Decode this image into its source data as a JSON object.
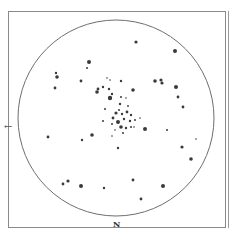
{
  "chart_data": {
    "type": "scatter",
    "title": "",
    "frame": {
      "x": 8,
      "y": 11,
      "w": 217,
      "h": 216,
      "second_line_x": 228
    },
    "field": {
      "cx": 116,
      "cy": 118,
      "r": 98
    },
    "orientation": {
      "north_label": "N",
      "east_arrow": "←"
    },
    "stars": [
      {
        "x": 136,
        "y": 42,
        "r": 1.6
      },
      {
        "x": 175,
        "y": 51,
        "r": 2.0
      },
      {
        "x": 56,
        "y": 73,
        "r": 1.2
      },
      {
        "x": 57,
        "y": 77,
        "r": 1.8
      },
      {
        "x": 89,
        "y": 62,
        "r": 2.0
      },
      {
        "x": 87,
        "y": 68,
        "r": 1.0
      },
      {
        "x": 55,
        "y": 88,
        "r": 1.4
      },
      {
        "x": 81,
        "y": 81,
        "r": 1.4
      },
      {
        "x": 121,
        "y": 81,
        "r": 1.2
      },
      {
        "x": 155,
        "y": 81,
        "r": 1.8
      },
      {
        "x": 161,
        "y": 80,
        "r": 1.6
      },
      {
        "x": 162,
        "y": 83,
        "r": 1.6
      },
      {
        "x": 133,
        "y": 90,
        "r": 1.8
      },
      {
        "x": 176,
        "y": 87,
        "r": 2.0
      },
      {
        "x": 178,
        "y": 97,
        "r": 1.4
      },
      {
        "x": 183,
        "y": 107,
        "r": 1.4
      },
      {
        "x": 98,
        "y": 89,
        "r": 1.4
      },
      {
        "x": 103,
        "y": 87,
        "r": 1.2
      },
      {
        "x": 97,
        "y": 92,
        "r": 1.8
      },
      {
        "x": 109,
        "y": 89,
        "r": 1.2
      },
      {
        "x": 110,
        "y": 98,
        "r": 2.2
      },
      {
        "x": 112,
        "y": 94,
        "r": 1.2
      },
      {
        "x": 107,
        "y": 78,
        "r": 0.8
      },
      {
        "x": 110,
        "y": 80,
        "r": 0.8
      },
      {
        "x": 105,
        "y": 109,
        "r": 1.0
      },
      {
        "x": 121,
        "y": 97,
        "r": 1.0
      },
      {
        "x": 126,
        "y": 98,
        "r": 0.8
      },
      {
        "x": 120,
        "y": 104,
        "r": 1.2
      },
      {
        "x": 128,
        "y": 106,
        "r": 0.9
      },
      {
        "x": 119,
        "y": 110,
        "r": 1.0
      },
      {
        "x": 116,
        "y": 113,
        "r": 1.6
      },
      {
        "x": 122,
        "y": 114,
        "r": 1.2
      },
      {
        "x": 127,
        "y": 112,
        "r": 1.4
      },
      {
        "x": 131,
        "y": 115,
        "r": 1.2
      },
      {
        "x": 113,
        "y": 118,
        "r": 1.4
      },
      {
        "x": 118,
        "y": 122,
        "r": 2.0
      },
      {
        "x": 124,
        "y": 119,
        "r": 1.2
      },
      {
        "x": 130,
        "y": 121,
        "r": 1.2
      },
      {
        "x": 135,
        "y": 120,
        "r": 1.0
      },
      {
        "x": 140,
        "y": 118,
        "r": 0.8
      },
      {
        "x": 112,
        "y": 124,
        "r": 1.0
      },
      {
        "x": 121,
        "y": 127,
        "r": 1.8
      },
      {
        "x": 126,
        "y": 128,
        "r": 1.2
      },
      {
        "x": 131,
        "y": 127,
        "r": 1.0
      },
      {
        "x": 115,
        "y": 130,
        "r": 0.8
      },
      {
        "x": 123,
        "y": 133,
        "r": 1.0
      },
      {
        "x": 103,
        "y": 121,
        "r": 1.0
      },
      {
        "x": 145,
        "y": 129,
        "r": 2.0
      },
      {
        "x": 112,
        "y": 136,
        "r": 0.8
      },
      {
        "x": 118,
        "y": 148,
        "r": 1.2
      },
      {
        "x": 92,
        "y": 135,
        "r": 1.8
      },
      {
        "x": 82,
        "y": 140,
        "r": 1.2
      },
      {
        "x": 48,
        "y": 137,
        "r": 1.4
      },
      {
        "x": 167,
        "y": 130,
        "r": 1.0
      },
      {
        "x": 182,
        "y": 147,
        "r": 1.6
      },
      {
        "x": 191,
        "y": 159,
        "r": 1.8
      },
      {
        "x": 134,
        "y": 127,
        "r": 0.8
      },
      {
        "x": 63,
        "y": 184,
        "r": 1.4
      },
      {
        "x": 68,
        "y": 181,
        "r": 1.6
      },
      {
        "x": 81,
        "y": 186,
        "r": 2.0
      },
      {
        "x": 104,
        "y": 188,
        "r": 1.2
      },
      {
        "x": 133,
        "y": 180,
        "r": 1.4
      },
      {
        "x": 163,
        "y": 186,
        "r": 2.0
      },
      {
        "x": 141,
        "y": 199,
        "r": 1.4
      },
      {
        "x": 196,
        "y": 139,
        "r": 0.8
      }
    ]
  },
  "labels": {
    "north": "N",
    "east_arrow": "←"
  },
  "colors": {
    "frame": "#8a8a8a",
    "circle": "#6e6e6e",
    "star": "#3a3a3a",
    "background": "#ffffff"
  }
}
